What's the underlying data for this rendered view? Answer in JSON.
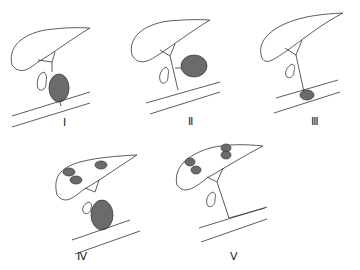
{
  "diagram": {
    "type": "choledochal-cyst-classification",
    "cyst_color": "#6b6b6b",
    "line_color": "#333333",
    "panels": [
      {
        "id": "I",
        "label": "Ⅰ"
      },
      {
        "id": "II",
        "label": "Ⅱ"
      },
      {
        "id": "III",
        "label": "Ⅲ"
      },
      {
        "id": "IV",
        "label": "Ⅳ"
      },
      {
        "id": "V",
        "label": "Ⅴ"
      }
    ]
  }
}
